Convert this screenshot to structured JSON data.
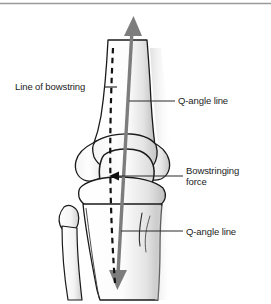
{
  "figure": {
    "type": "anatomical-illustration",
    "background_color": "#ffffff",
    "top_rule_color": "#9a9a9a"
  },
  "colors": {
    "vector_gray": "#7d7d7d",
    "bone_outline": "#1a1a1a",
    "bone_fill": "#fcfcfc",
    "bone_shadow": "#c9c9c9",
    "leader_line": "#2a2a2a",
    "dashed_line": "#111111",
    "text": "#1c1c1c"
  },
  "labels": {
    "line_of_bowstring": "Line of bowstring",
    "q_angle_upper": "Q-angle line",
    "bowstringing_force_line1": "Bowstringing",
    "bowstringing_force_line2": "force",
    "q_angle_lower": "Q-angle line"
  },
  "annotations": {
    "q_angle_vector": {
      "name": "q-angle-line-vector",
      "style": "solid double-headed arrow",
      "color": "#7d7d7d"
    },
    "bowstring_vector": {
      "name": "line-of-bowstring-vector",
      "style": "dashed line",
      "color": "#111111"
    },
    "bowstringing_force_arrow": {
      "name": "bowstringing-force-arrow",
      "style": "short left-pointing arrow",
      "color": "#111111"
    }
  },
  "anatomy": {
    "parts": [
      "femur-shaft",
      "medial-femoral-condyle",
      "lateral-femoral-condyle",
      "patella",
      "tibial-plateau",
      "tibia-shaft",
      "tibial-tuberosity",
      "fibula-head",
      "fibula-shaft"
    ]
  }
}
